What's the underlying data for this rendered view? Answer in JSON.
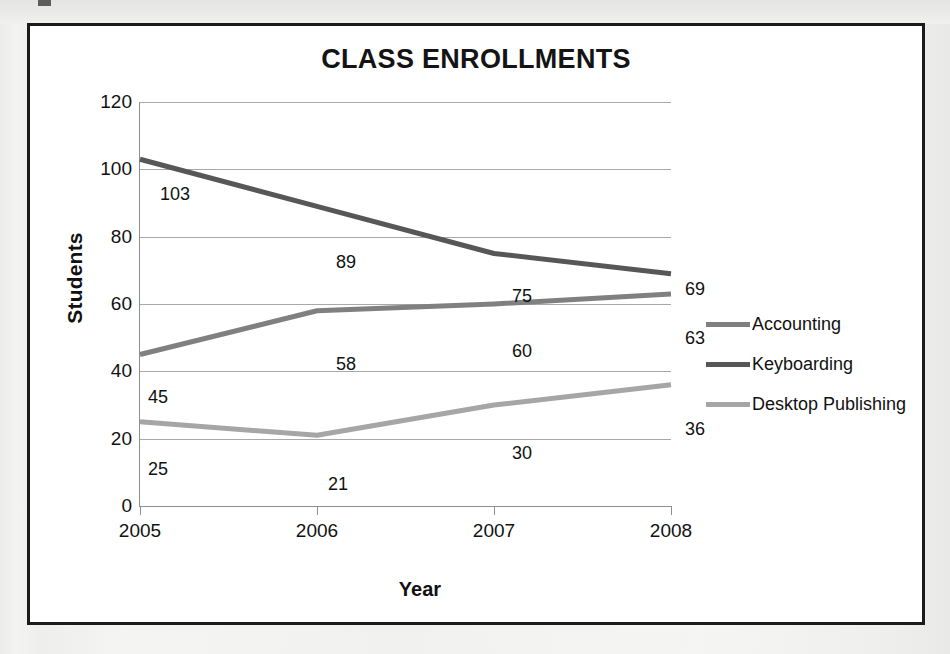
{
  "chart_data": {
    "type": "line",
    "title": "CLASS ENROLLMENTS",
    "xlabel": "Year",
    "ylabel": "Students",
    "categories": [
      "2005",
      "2006",
      "2007",
      "2008"
    ],
    "ylim": [
      0,
      120
    ],
    "yticks": [
      "0",
      "20",
      "40",
      "60",
      "80",
      "100",
      "120"
    ],
    "grid": true,
    "legend_position": "right",
    "series": [
      {
        "name": "Accounting",
        "color": "#808080",
        "values": [
          45,
          58,
          60,
          63
        ],
        "labels": [
          "45",
          "58",
          "60",
          "63"
        ]
      },
      {
        "name": "Keyboarding",
        "color": "#575757",
        "values": [
          103,
          89,
          75,
          69
        ],
        "labels": [
          "103",
          "89",
          "75",
          "69"
        ]
      },
      {
        "name": "Desktop Publishing",
        "color": "#a6a6a6",
        "values": [
          25,
          21,
          30,
          36
        ],
        "labels": [
          "25",
          "21",
          "30",
          "36"
        ]
      }
    ],
    "data_labels": [
      {
        "text": "103",
        "x": 20,
        "y": 82,
        "series": "Keyboarding"
      },
      {
        "text": "89",
        "x": 196,
        "y": 150,
        "series": "Keyboarding"
      },
      {
        "text": "75",
        "x": 372,
        "y": 184,
        "series": "Keyboarding"
      },
      {
        "text": "69",
        "x": 545,
        "y": 177,
        "series": "Keyboarding"
      },
      {
        "text": "45",
        "x": 8,
        "y": 285,
        "series": "Accounting"
      },
      {
        "text": "58",
        "x": 196,
        "y": 252,
        "series": "Accounting"
      },
      {
        "text": "60",
        "x": 372,
        "y": 239,
        "series": "Accounting"
      },
      {
        "text": "63",
        "x": 545,
        "y": 226,
        "series": "Accounting"
      },
      {
        "text": "25",
        "x": 8,
        "y": 357,
        "series": "Desktop Publishing"
      },
      {
        "text": "21",
        "x": 188,
        "y": 372,
        "series": "Desktop Publishing"
      },
      {
        "text": "30",
        "x": 372,
        "y": 341,
        "series": "Desktop Publishing"
      },
      {
        "text": "36",
        "x": 545,
        "y": 317,
        "series": "Desktop Publishing"
      }
    ]
  }
}
